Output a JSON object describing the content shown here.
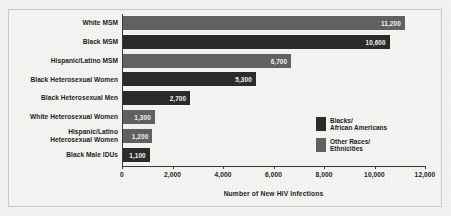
{
  "chart_data": {
    "type": "bar",
    "orientation": "horizontal",
    "title": "",
    "xlabel": "Number of New HIV Infections",
    "ylabel": "",
    "xlim": [
      0,
      12000
    ],
    "xticks": [
      "0",
      "2,000",
      "4,000",
      "6,000",
      "8,000",
      "10,000",
      "12,000"
    ],
    "xtick_values": [
      0,
      2000,
      4000,
      6000,
      8000,
      10000,
      12000
    ],
    "grid": false,
    "legend_position": "middle-right",
    "categories": [
      "White MSM",
      "Black MSM",
      "Hispanic/Latino MSM",
      "Black Heterosexual Women",
      "Black Heterosexual Men",
      "White Heterosexual Women",
      "Hispanic/Latino Heterosexual Women",
      "Black Male IDUs"
    ],
    "values": [
      11200,
      10600,
      6700,
      5300,
      2700,
      1300,
      1200,
      1100
    ],
    "value_labels": [
      "11,200",
      "10,600",
      "6,700",
      "5,300",
      "2,700",
      "1,300",
      "1,200",
      "1,100"
    ],
    "groups": [
      "Other Races/Ethnicities",
      "Blacks/African Americans",
      "Other Races/Ethnicities",
      "Blacks/African Americans",
      "Blacks/African Americans",
      "Other Races/Ethnicities",
      "Other Races/Ethnicities",
      "Blacks/African Americans"
    ],
    "bars": [
      {
        "label": "White MSM",
        "label_lines": [
          "White MSM"
        ],
        "value": 11200,
        "value_label": "11,200",
        "group": "other",
        "color": "#616161"
      },
      {
        "label": "Black MSM",
        "label_lines": [
          "Black MSM"
        ],
        "value": 10600,
        "value_label": "10,600",
        "group": "black",
        "color": "#2b2b2b"
      },
      {
        "label": "Hispanic/Latino MSM",
        "label_lines": [
          "Hispanic/Latino MSM"
        ],
        "value": 6700,
        "value_label": "6,700",
        "group": "other",
        "color": "#616161"
      },
      {
        "label": "Black Heterosexual Women",
        "label_lines": [
          "Black Heterosexual Women"
        ],
        "value": 5300,
        "value_label": "5,300",
        "group": "black",
        "color": "#2b2b2b"
      },
      {
        "label": "Black Heterosexual Men",
        "label_lines": [
          "Black Heterosexual Men"
        ],
        "value": 2700,
        "value_label": "2,700",
        "group": "black",
        "color": "#2b2b2b"
      },
      {
        "label": "White Heterosexual Women",
        "label_lines": [
          "White Heterosexual Women"
        ],
        "value": 1300,
        "value_label": "1,300",
        "group": "other",
        "color": "#616161"
      },
      {
        "label": "Hispanic/Latino Heterosexual Women",
        "label_lines": [
          "Hispanic/Latino",
          "Heterosexual Women"
        ],
        "value": 1200,
        "value_label": "1,200",
        "group": "other",
        "color": "#616161"
      },
      {
        "label": "Black Male IDUs",
        "label_lines": [
          "Black Male IDUs"
        ],
        "value": 1100,
        "value_label": "1,100",
        "group": "black",
        "color": "#2b2b2b"
      }
    ],
    "legend": [
      {
        "swatch": "black",
        "color": "#2b2b2b",
        "lines": [
          "Blacks/",
          "African Americans"
        ],
        "label": "Blacks/African Americans"
      },
      {
        "swatch": "gray",
        "color": "#616161",
        "lines": [
          "Other Races/",
          "Ethnicities"
        ],
        "label": "Other Races/Ethnicities"
      }
    ]
  },
  "colors": {
    "background": "#f2f2f0",
    "plate": "#f4f4f2",
    "frame": "#c9c9c6",
    "axis": "#3a3a3a",
    "text": "#1d1d1d",
    "bar_black": "#2b2b2b",
    "bar_gray": "#616161",
    "value_text": "#f4f4f2"
  }
}
